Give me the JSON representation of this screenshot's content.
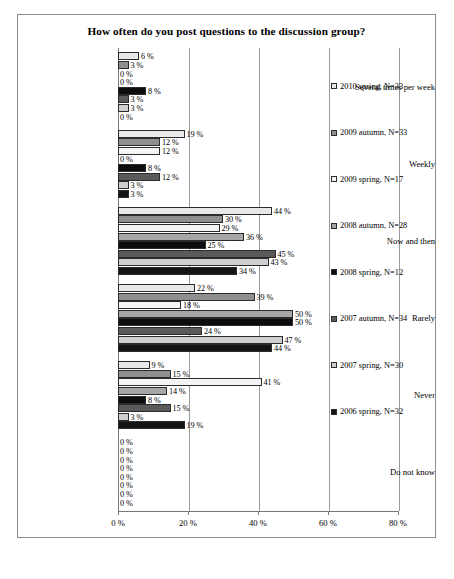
{
  "chart_data": {
    "type": "bar",
    "orientation": "horizontal",
    "title": "How often do you post questions to the discussion group?",
    "xlabel": "",
    "ylabel": "",
    "xlim": [
      0,
      80
    ],
    "xticks": [
      "0 %",
      "20 %",
      "40 %",
      "60 %",
      "80 %"
    ],
    "xtick_values": [
      0,
      20,
      40,
      60,
      80
    ],
    "grid": true,
    "legend_position": "right",
    "value_suffix": " %",
    "categories": [
      "Several times per week",
      "Weekly",
      "Now and then",
      "Rarely",
      "Never",
      "Do not know"
    ],
    "series": [
      {
        "name": "2010 spring, N=33",
        "values": [
          6,
          19,
          44,
          22,
          9,
          0
        ]
      },
      {
        "name": "2009 autumn, N=33",
        "values": [
          3,
          12,
          30,
          39,
          15,
          0
        ]
      },
      {
        "name": "2009 spring, N=17",
        "values": [
          0,
          12,
          29,
          18,
          41,
          0
        ]
      },
      {
        "name": "2008 autumn, N=28",
        "values": [
          0,
          0,
          36,
          50,
          14,
          0
        ]
      },
      {
        "name": "2008 spring, N=12",
        "values": [
          8,
          8,
          25,
          50,
          8,
          0
        ]
      },
      {
        "name": "2007 autumn, N=34",
        "values": [
          3,
          12,
          45,
          24,
          15,
          0
        ]
      },
      {
        "name": "2007 spring, N=30",
        "values": [
          3,
          3,
          43,
          47,
          3,
          0
        ]
      },
      {
        "name": "2006 spring, N=32",
        "values": [
          0,
          3,
          34,
          44,
          19,
          0
        ]
      }
    ]
  }
}
